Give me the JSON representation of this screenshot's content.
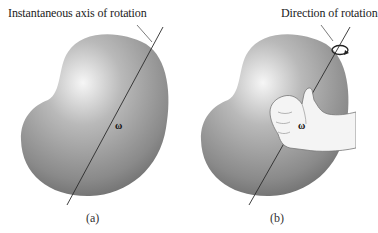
{
  "figure": {
    "panels": [
      {
        "id": "a",
        "title": "Instantaneous axis of rotation",
        "vector_label": "ω",
        "caption": "(a)"
      },
      {
        "id": "b",
        "title": "Direction of rotation",
        "vector_label": "ω",
        "caption": "(b)",
        "icons": [
          "rotation-arrow-icon",
          "right-hand-rule-icon"
        ]
      }
    ],
    "colors": {
      "body_light": "#f2f2f2",
      "body_mid": "#a8a8a8",
      "body_dark": "#6e6e6e",
      "axis_line": "#2a2a2a",
      "hand_fill": "#f4f4f4",
      "hand_outline": "#777777"
    }
  }
}
